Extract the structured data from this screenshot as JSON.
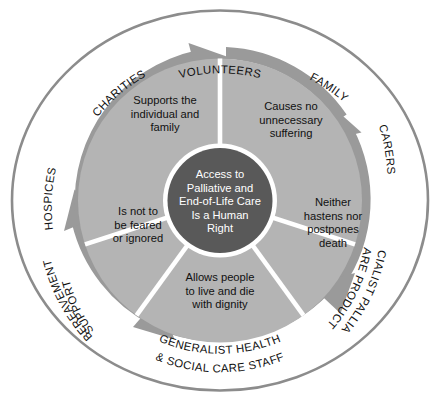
{
  "diagram": {
    "title": "Access to Palliative and End-of-Life Care Is a Human Right",
    "type": "cycle-wheel",
    "center": {
      "lines": [
        "Access to",
        "Palliative and",
        "End-of-Life Care",
        "Is a Human",
        "Right"
      ]
    },
    "segments": [
      {
        "id": "supports",
        "lines": [
          "Supports the",
          "individual and",
          "family"
        ]
      },
      {
        "id": "no-suffering",
        "lines": [
          "Causes no",
          "unnecessary",
          "suffering"
        ]
      },
      {
        "id": "neither-hastens",
        "lines": [
          "Neither",
          "hastens nor",
          "postpones",
          "death"
        ]
      },
      {
        "id": "live-and-die",
        "lines": [
          "Allows people",
          "to live and die",
          "with dignity"
        ]
      },
      {
        "id": "not-feared",
        "lines": [
          "Is not to",
          "be feared",
          "or ignored"
        ]
      }
    ],
    "ring_labels": [
      {
        "id": "volunteers",
        "lines": [
          "VOLUNTEERS"
        ]
      },
      {
        "id": "family",
        "lines": [
          "FAMILY"
        ]
      },
      {
        "id": "carers",
        "lines": [
          "CARERS"
        ]
      },
      {
        "id": "specialist-palliative-care-products",
        "lines": [
          "SPECIALIST PALLIATIVE",
          "CARE PRODUCTS"
        ]
      },
      {
        "id": "generalist-health-social-care-staff",
        "lines": [
          "GENERALIST HEALTH",
          "& SOCIAL CARE STAFF"
        ]
      },
      {
        "id": "bereavement-support",
        "lines": [
          "BEREAVEMENT",
          "SUPPORT"
        ]
      },
      {
        "id": "hospices",
        "lines": [
          "HOSPICES"
        ]
      },
      {
        "id": "charities",
        "lines": [
          "CHARITIES"
        ]
      }
    ],
    "colors": {
      "background": "#ffffff",
      "outer_ring_stroke": "#8c8c8c",
      "arrow_ring": "#9a9a9a",
      "segment_fill": "#b4b4b4",
      "segment_divider": "#ffffff",
      "center_fill": "#595959",
      "center_text": "#ffffff",
      "segment_text": "#111111",
      "ring_label_text": "#111111"
    }
  }
}
